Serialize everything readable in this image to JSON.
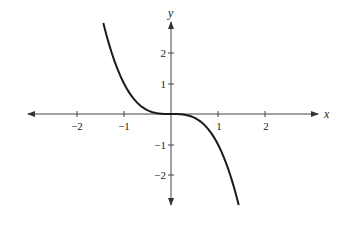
{
  "chart_data": {
    "type": "line",
    "title": "",
    "function": "y = -x^3",
    "xlabel": "x",
    "ylabel": "y",
    "xlim": [
      -3.2,
      3.0
    ],
    "ylim": [
      -3.0,
      3.1
    ],
    "grid": false,
    "legend": null,
    "x_ticks": [
      -2,
      -1,
      1,
      2
    ],
    "x_tick_labels": [
      "−2",
      "−1",
      "1",
      "2"
    ],
    "y_ticks": [
      -2,
      -1,
      1,
      2
    ],
    "y_tick_labels": [
      "−2",
      "−1",
      "1",
      "2"
    ],
    "series": [
      {
        "name": "y = -x^3",
        "x": [
          -1.44,
          -1.2,
          -1.0,
          -0.8,
          -0.6,
          -0.4,
          -0.2,
          0,
          0.2,
          0.4,
          0.6,
          0.8,
          1.0,
          1.2,
          1.44
        ],
        "y": [
          2.99,
          1.73,
          1.0,
          0.51,
          0.22,
          0.06,
          0.01,
          0,
          -0.01,
          -0.06,
          -0.22,
          -0.51,
          -1.0,
          -1.73,
          -2.99
        ]
      }
    ]
  },
  "labels": {
    "x_axis": "x",
    "y_axis": "y",
    "xt": [
      "−2",
      "−1",
      "1",
      "2"
    ],
    "yt": [
      "2",
      "1",
      "−1",
      "−2"
    ]
  }
}
